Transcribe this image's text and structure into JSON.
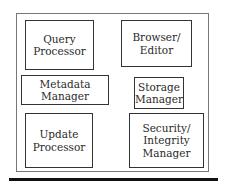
{
  "diagram": {
    "title": "",
    "components": [
      {
        "id": "query-processor",
        "label": "Query\nProcessor"
      },
      {
        "id": "browser-editor",
        "label": "Browser/\nEditor"
      },
      {
        "id": "metadata-manager",
        "label": "Metadata Manager"
      },
      {
        "id": "storage-manager",
        "label": "Storage\nManager"
      },
      {
        "id": "update-processor",
        "label": "Update\nProcessor"
      },
      {
        "id": "security-integrity-manager",
        "label": "Security/\nIntegrity\nManager"
      }
    ],
    "colors": {
      "border": "#333333",
      "outer_border": "#777777",
      "rule": "#111111",
      "background": "#ffffff"
    }
  }
}
